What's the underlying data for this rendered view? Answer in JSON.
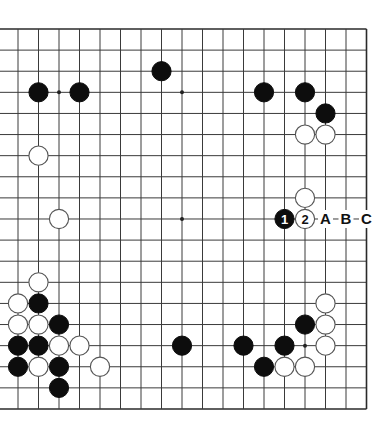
{
  "diagram": {
    "type": "go-board",
    "board_size": 19,
    "visible_columns": [
      1,
      18
    ],
    "visible_rows": [
      0,
      18
    ],
    "edges_shown": [
      "top",
      "right",
      "bottom"
    ],
    "hoshi": [
      [
        3,
        3
      ],
      [
        9,
        3
      ],
      [
        15,
        3
      ],
      [
        3,
        9
      ],
      [
        9,
        9
      ],
      [
        15,
        9
      ],
      [
        3,
        15
      ],
      [
        9,
        15
      ],
      [
        15,
        15
      ]
    ],
    "stones": [
      {
        "color": "black",
        "col": 2,
        "row": 3
      },
      {
        "color": "black",
        "col": 4,
        "row": 3
      },
      {
        "color": "black",
        "col": 8,
        "row": 2
      },
      {
        "color": "black",
        "col": 13,
        "row": 3
      },
      {
        "color": "black",
        "col": 15,
        "row": 3
      },
      {
        "color": "black",
        "col": 16,
        "row": 4
      },
      {
        "color": "white",
        "col": 15,
        "row": 5
      },
      {
        "color": "white",
        "col": 16,
        "row": 5
      },
      {
        "color": "white",
        "col": 15,
        "row": 8
      },
      {
        "color": "white",
        "col": 2,
        "row": 6
      },
      {
        "color": "white",
        "col": 3,
        "row": 9
      },
      {
        "color": "white",
        "col": 2,
        "row": 12
      },
      {
        "color": "white",
        "col": 1,
        "row": 13
      },
      {
        "color": "black",
        "col": 2,
        "row": 13
      },
      {
        "color": "white",
        "col": 1,
        "row": 14
      },
      {
        "color": "white",
        "col": 2,
        "row": 14
      },
      {
        "color": "black",
        "col": 3,
        "row": 14
      },
      {
        "color": "black",
        "col": 1,
        "row": 15
      },
      {
        "color": "black",
        "col": 2,
        "row": 15
      },
      {
        "color": "white",
        "col": 3,
        "row": 15
      },
      {
        "color": "white",
        "col": 4,
        "row": 15
      },
      {
        "color": "black",
        "col": 1,
        "row": 16
      },
      {
        "color": "white",
        "col": 2,
        "row": 16
      },
      {
        "color": "black",
        "col": 3,
        "row": 16
      },
      {
        "color": "white",
        "col": 5,
        "row": 16
      },
      {
        "color": "black",
        "col": 3,
        "row": 17
      },
      {
        "color": "black",
        "col": 9,
        "row": 15
      },
      {
        "color": "white",
        "col": 16,
        "row": 13
      },
      {
        "color": "black",
        "col": 15,
        "row": 14
      },
      {
        "color": "white",
        "col": 16,
        "row": 14
      },
      {
        "color": "black",
        "col": 12,
        "row": 15
      },
      {
        "color": "black",
        "col": 14,
        "row": 15
      },
      {
        "color": "white",
        "col": 16,
        "row": 15
      },
      {
        "color": "black",
        "col": 13,
        "row": 16
      },
      {
        "color": "white",
        "col": 14,
        "row": 16
      },
      {
        "color": "white",
        "col": 15,
        "row": 16
      }
    ],
    "numbered_moves": [
      {
        "number": "1",
        "color": "black",
        "col": 14,
        "row": 9
      },
      {
        "number": "2",
        "color": "white",
        "col": 15,
        "row": 9
      }
    ],
    "letter_labels": [
      {
        "text": "A",
        "col": 16,
        "row": 9
      },
      {
        "text": "B",
        "col": 17,
        "row": 9
      },
      {
        "text": "C",
        "col": 18,
        "row": 9
      }
    ],
    "colors": {
      "black_stone": "#0d0d0d",
      "white_stone": "#ffffff",
      "grid": "#3a3a3a",
      "background": "#ffffff"
    }
  }
}
